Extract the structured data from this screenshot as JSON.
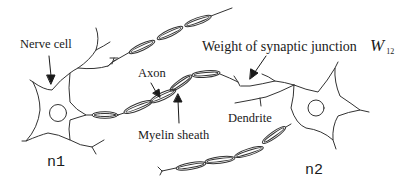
{
  "diagram": {
    "type": "neuron-network-illustration",
    "labels": {
      "nerve_cell": "Nerve cell",
      "axon": "Axon",
      "myelin_sheath": "Myelin sheath",
      "dendrite": "Dendrite",
      "synaptic_weight": "Weight of synaptic junction",
      "weight_symbol": "W",
      "weight_subscript": "12",
      "neuron_1": "n1",
      "neuron_2": "n2"
    },
    "colors": {
      "stroke": "#333333",
      "text": "#1a1a1a",
      "background": "#ffffff"
    },
    "nodes": [
      {
        "id": "n1",
        "label": "n1"
      },
      {
        "id": "n2",
        "label": "n2"
      }
    ],
    "edges": [
      {
        "from": "n1",
        "to": "n2",
        "label": "W12"
      }
    ]
  }
}
